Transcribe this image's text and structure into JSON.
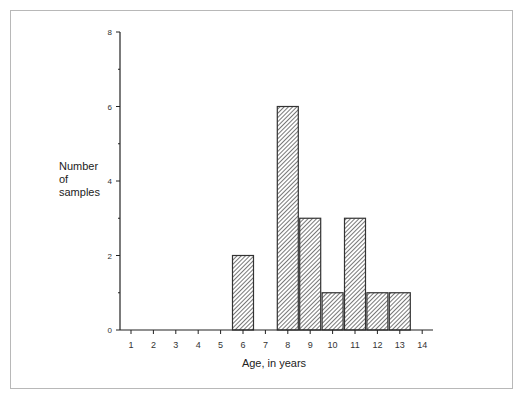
{
  "chart_data": {
    "type": "bar",
    "title": "",
    "xlabel": "Age, in years",
    "ylabel": "Number of samples",
    "ylabel_lines": [
      "Number",
      "of",
      "samples"
    ],
    "categories": [
      "1",
      "2",
      "3",
      "4",
      "5",
      "6",
      "7",
      "8",
      "9",
      "10",
      "11",
      "12",
      "13",
      "14"
    ],
    "values": [
      0,
      0,
      0,
      0,
      0,
      2,
      0,
      6,
      3,
      1,
      3,
      1,
      1,
      0
    ],
    "ylim": [
      0,
      8
    ],
    "yticks_labeled": [
      0,
      2,
      4,
      6,
      8
    ],
    "yticks_minor": [
      1,
      3,
      5,
      7
    ],
    "xticks": [
      1,
      2,
      3,
      4,
      5,
      6,
      7,
      8,
      9,
      10,
      11,
      12,
      13,
      14
    ],
    "grid": false,
    "legend": null,
    "bar_fill": "diagonal hatch",
    "colors": {
      "bar_stroke": "#333333",
      "hatch": "#555555",
      "axis": "#222222",
      "frame": "#b8b8b8"
    }
  }
}
